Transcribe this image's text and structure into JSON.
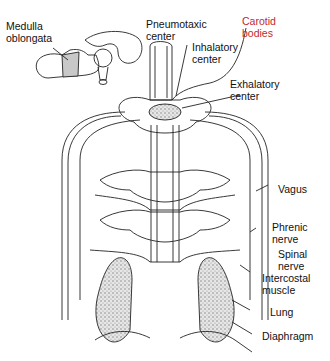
{
  "diagram": {
    "colors": {
      "line": "#222222",
      "label": "#111111",
      "highlight_label": "#c0282d",
      "medulla_fill": "#c8c8c8",
      "lung_fill": "#d9d9d9"
    },
    "labels": {
      "medulla": "Medulla\noblongata",
      "pneumotaxic": "Pneumotaxic\ncenter",
      "carotid": "Carotid\nbodies",
      "inhalatory": "Inhalatory\ncenter",
      "exhalatory": "Exhalatory\ncenter",
      "vagus": "Vagus",
      "phrenic": "Phrenic\nnerve",
      "spinal": "Spinal\nnerve",
      "intercostal": "Intercostal\nmuscle",
      "lung": "Lung",
      "diaphragm": "Diaphragm"
    }
  }
}
